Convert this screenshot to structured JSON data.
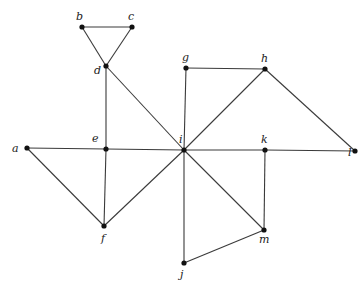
{
  "figure": {
    "type": "undirected-graph",
    "vertices": [
      {
        "id": "a",
        "label": "a",
        "x": 27,
        "y": 148,
        "lx": 12,
        "ly": 152
      },
      {
        "id": "b",
        "label": "b",
        "x": 82,
        "y": 27,
        "lx": 76,
        "ly": 20
      },
      {
        "id": "c",
        "label": "c",
        "x": 132,
        "y": 27,
        "lx": 128,
        "ly": 20
      },
      {
        "id": "d",
        "label": "d",
        "x": 106,
        "y": 66,
        "lx": 94,
        "ly": 74
      },
      {
        "id": "e",
        "label": "e",
        "x": 106,
        "y": 149,
        "lx": 92,
        "ly": 142
      },
      {
        "id": "f",
        "label": "f",
        "x": 104,
        "y": 226,
        "lx": 101,
        "ly": 242
      },
      {
        "id": "g",
        "label": "g",
        "x": 186,
        "y": 68,
        "lx": 182,
        "ly": 61
      },
      {
        "id": "h",
        "label": "h",
        "x": 265,
        "y": 69,
        "lx": 261,
        "ly": 62
      },
      {
        "id": "i",
        "label": "i",
        "x": 184,
        "y": 150,
        "lx": 179,
        "ly": 143
      },
      {
        "id": "k",
        "label": "k",
        "x": 265,
        "y": 150,
        "lx": 261,
        "ly": 143
      },
      {
        "id": "l",
        "label": "l",
        "x": 355,
        "y": 151,
        "lx": 348,
        "ly": 156
      },
      {
        "id": "m",
        "label": "m",
        "x": 264,
        "y": 230,
        "lx": 259,
        "ly": 243
      },
      {
        "id": "j",
        "label": "j",
        "x": 184,
        "y": 263,
        "lx": 180,
        "ly": 278
      }
    ],
    "edges": [
      [
        "b",
        "c"
      ],
      [
        "b",
        "d"
      ],
      [
        "c",
        "d"
      ],
      [
        "d",
        "e"
      ],
      [
        "d",
        "i"
      ],
      [
        "a",
        "e"
      ],
      [
        "e",
        "i"
      ],
      [
        "i",
        "k"
      ],
      [
        "k",
        "l"
      ],
      [
        "a",
        "f"
      ],
      [
        "e",
        "f"
      ],
      [
        "f",
        "i"
      ],
      [
        "g",
        "h"
      ],
      [
        "g",
        "i"
      ],
      [
        "h",
        "i"
      ],
      [
        "h",
        "l"
      ],
      [
        "i",
        "m"
      ],
      [
        "k",
        "m"
      ],
      [
        "i",
        "j"
      ],
      [
        "j",
        "m"
      ]
    ]
  }
}
